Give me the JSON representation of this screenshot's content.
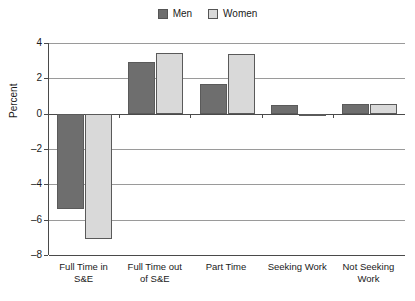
{
  "chart_data": {
    "type": "bar",
    "title": "",
    "subtitle": "",
    "xlabel": "",
    "ylabel": "Percent",
    "ylim": [
      -8,
      4
    ],
    "yticks": [
      4,
      2,
      0,
      -2,
      -4,
      -6,
      -8
    ],
    "ytick_labels": [
      "4",
      "2",
      "0",
      "–2",
      "–4",
      "–6",
      "–8"
    ],
    "grid": true,
    "legend_position": "top-center",
    "categories": [
      "Full Time in\nS&E",
      "Full Time out\nof S&E",
      "Part Time",
      "Seeking Work",
      "Not Seeking\nWork"
    ],
    "categories_flat": [
      "Full Time in S&E",
      "Full Time out of S&E",
      "Part Time",
      "Seeking Work",
      "Not Seeking Work"
    ],
    "series": [
      {
        "name": "Men",
        "color": "#6e6e6e",
        "values": [
          -5.4,
          2.9,
          1.7,
          0.5,
          0.55
        ]
      },
      {
        "name": "Women",
        "color": "#d9d9d9",
        "values": [
          -7.1,
          3.45,
          3.4,
          -0.1,
          0.55
        ]
      }
    ]
  },
  "legend": {
    "entries": [
      {
        "label": "Men",
        "swatch": "men-swatch"
      },
      {
        "label": "Women",
        "swatch": "women-swatch"
      }
    ]
  }
}
